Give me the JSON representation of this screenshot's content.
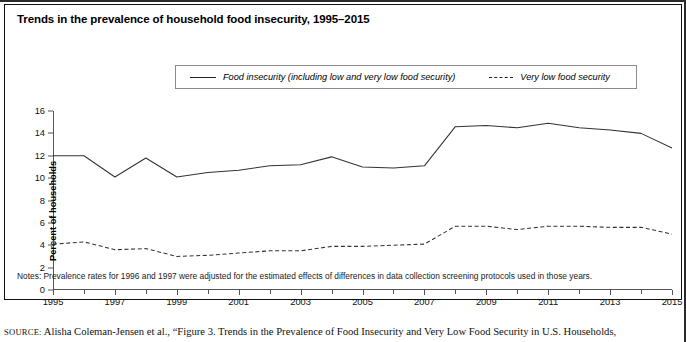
{
  "figure": {
    "title": "Trends in the prevalence of household food insecurity, 1995–2015",
    "notes": "Notes: Prevalence rates for 1996 and 1997 were adjusted for the estimated effects of differences in data collection screening protocols used in those years.",
    "source_label": "SOURCE:",
    "source_text": "Alisha Coleman-Jensen et al., “Figure 3. Trends in the Prevalence of Food Insecurity and Very Low Food Security in U.S. Households,"
  },
  "legend": {
    "items": [
      {
        "label": "Food insecurity (including low and very low food security)",
        "style": "solid",
        "color": "#222222"
      },
      {
        "label": "Very low food security",
        "style": "dashed",
        "color": "#222222"
      }
    ]
  },
  "chart_data": {
    "type": "line",
    "title": "Trends in the prevalence of household food insecurity, 1995–2015",
    "xlabel": "",
    "ylabel": "Percent of households",
    "xlim": [
      1995,
      2015
    ],
    "ylim": [
      0,
      16
    ],
    "yticks": [
      0,
      2,
      4,
      6,
      8,
      10,
      12,
      14,
      16
    ],
    "xticks": [
      1995,
      1997,
      1999,
      2001,
      2003,
      2005,
      2007,
      2009,
      2011,
      2013,
      2015
    ],
    "xticks_minor": [
      1996,
      1998,
      2000,
      2002,
      2004,
      2006,
      2008,
      2010,
      2012,
      2014
    ],
    "grid": false,
    "legend_position": "top",
    "x": [
      1995,
      1996,
      1997,
      1998,
      1999,
      2000,
      2001,
      2002,
      2003,
      2004,
      2005,
      2006,
      2007,
      2008,
      2009,
      2010,
      2011,
      2012,
      2013,
      2014,
      2015
    ],
    "series": [
      {
        "name": "Food insecurity (including low and very low food security)",
        "style": "solid",
        "values": [
          12.0,
          12.0,
          10.1,
          11.8,
          10.1,
          10.5,
          10.7,
          11.1,
          11.2,
          11.9,
          11.0,
          10.9,
          11.1,
          14.6,
          14.7,
          14.5,
          14.9,
          14.5,
          14.3,
          14.0,
          12.7
        ]
      },
      {
        "name": "Very low food security",
        "style": "dashed",
        "values": [
          4.1,
          4.3,
          3.6,
          3.7,
          3.0,
          3.1,
          3.3,
          3.5,
          3.5,
          3.9,
          3.9,
          4.0,
          4.1,
          5.7,
          5.7,
          5.4,
          5.7,
          5.7,
          5.6,
          5.6,
          5.0
        ]
      }
    ]
  }
}
